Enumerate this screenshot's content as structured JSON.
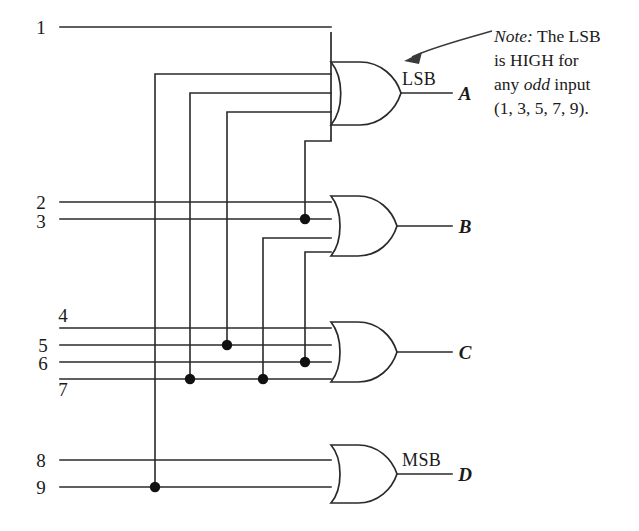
{
  "diagram": {
    "type": "logic-gate-schematic",
    "colors": {
      "wire": "#2a2a2a",
      "junction": "#111111",
      "background": "#ffffff",
      "annotation": "#3a3a3a"
    },
    "inputs": [
      {
        "id": "in1",
        "label": "1",
        "label_pos": "left",
        "y": 27
      },
      {
        "id": "in2",
        "label": "2",
        "label_pos": "left",
        "y": 202
      },
      {
        "id": "in3",
        "label": "3",
        "label_pos": "left",
        "y": 219
      },
      {
        "id": "in4",
        "label": "4",
        "label_pos": "above",
        "y": 328
      },
      {
        "id": "in5",
        "label": "5",
        "label_pos": "left",
        "y": 345
      },
      {
        "id": "in6",
        "label": "6",
        "label_pos": "left",
        "y": 362
      },
      {
        "id": "in7",
        "label": "7",
        "label_pos": "below",
        "y": 379
      },
      {
        "id": "in8",
        "label": "8",
        "label_pos": "left",
        "y": 460
      },
      {
        "id": "in9",
        "label": "9",
        "label_pos": "left",
        "y": 487
      }
    ],
    "gates": [
      {
        "id": "gateA",
        "kind": "OR",
        "inputs": 4,
        "output_label": "A",
        "significance_tag": "LSB"
      },
      {
        "id": "gateB",
        "kind": "OR",
        "inputs": 4,
        "output_label": "B",
        "significance_tag": ""
      },
      {
        "id": "gateC",
        "kind": "OR",
        "inputs": 4,
        "output_label": "C",
        "significance_tag": ""
      },
      {
        "id": "gateD",
        "kind": "OR",
        "inputs": 2,
        "output_label": "D",
        "significance_tag": "MSB"
      }
    ],
    "outputs": [
      {
        "id": "outA",
        "label": "A",
        "tag": "LSB"
      },
      {
        "id": "outB",
        "label": "B",
        "tag": ""
      },
      {
        "id": "outC",
        "label": "C",
        "tag": ""
      },
      {
        "id": "outD",
        "label": "D",
        "tag": "MSB"
      }
    ],
    "note": {
      "lead": "Note:",
      "line1_rest": " The LSB",
      "line2": "is HIGH for",
      "line3_a": "any ",
      "line3_em": "odd",
      "line3_b": " input",
      "line4": "(1, 3, 5, 7, 9).",
      "full_text": "Note: The LSB is HIGH for any odd input (1, 3, 5, 7, 9)."
    },
    "junction_dots": [
      {
        "x": 305,
        "y": 219
      },
      {
        "x": 227,
        "y": 345
      },
      {
        "x": 305,
        "y": 362
      },
      {
        "x": 190,
        "y": 379
      },
      {
        "x": 263,
        "y": 379
      },
      {
        "x": 155,
        "y": 487
      }
    ]
  }
}
